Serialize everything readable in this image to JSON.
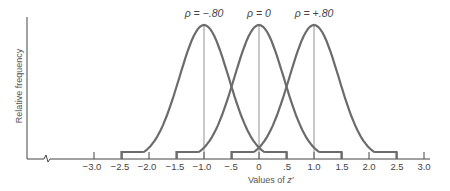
{
  "chart_data": {
    "type": "line",
    "title": "",
    "xlabel": "Values of z′",
    "ylabel": "Relative frequency",
    "xlim": [
      -3.0,
      3.0
    ],
    "x_ticks": [
      "−3.0",
      "−2.5",
      "−2.0",
      "−1.5",
      "−1.0",
      "−.5",
      "0",
      ".5",
      "1.0",
      "1.5",
      "2.0",
      "2.5",
      "3.0"
    ],
    "x_tick_values": [
      -3.0,
      -2.5,
      -2.0,
      -1.5,
      -1.0,
      -0.5,
      0,
      0.5,
      1.0,
      1.5,
      2.0,
      2.5,
      3.0
    ],
    "grid": false,
    "axis_break": true,
    "series": [
      {
        "name": "ρ = −.80",
        "center": -1.0,
        "range": [
          -2.5,
          0.5
        ],
        "peak_relative": 1.0
      },
      {
        "name": "ρ = 0",
        "center": 0.0,
        "range": [
          -1.5,
          1.5
        ],
        "peak_relative": 1.0
      },
      {
        "name": "ρ = +.80",
        "center": 1.0,
        "range": [
          -0.5,
          2.5
        ],
        "peak_relative": 1.0
      }
    ],
    "annotations": [
      "ρ = −.80",
      "ρ = 0",
      "ρ = +.80"
    ]
  },
  "labels": {
    "ylabel": "Relative frequency",
    "xlabel_prefix": "Values of ",
    "xlabel_var": "z′",
    "rho_neg": "ρ = −.80",
    "rho_zero": "ρ = 0",
    "rho_pos": "ρ = +.80",
    "ticks": [
      "−3.0",
      "−2.5",
      "−2.0",
      "−1.5",
      "−1.0",
      "−.5",
      "0",
      ".5",
      "1.0",
      "1.5",
      "2.0",
      "2.5",
      "3.0"
    ]
  },
  "colors": {
    "curve": "#6b6b6b",
    "axis": "#444444",
    "text": "#444444"
  }
}
